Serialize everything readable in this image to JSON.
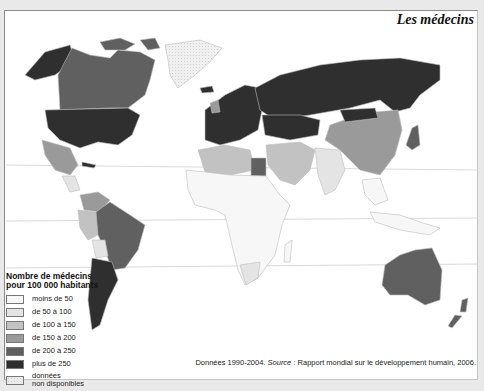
{
  "title": "Les médecins",
  "legend": {
    "title_line1": "Nombre de médecins",
    "title_line2": "pour 100 000 habitants",
    "items": [
      {
        "label": "moins de 50",
        "color": "#f7f7f7"
      },
      {
        "label": "de 50 à 100",
        "color": "#e4e4e4"
      },
      {
        "label": "de 100 à 150",
        "color": "#c2c2c2"
      },
      {
        "label": "de 150 à 200",
        "color": "#9a9a9a"
      },
      {
        "label": "de 200 à 250",
        "color": "#606060"
      },
      {
        "label": "plus de 250",
        "color": "#2f2f2f"
      },
      {
        "label": "données non disponibles",
        "label_line1": "données",
        "label_line2": "non disponibles",
        "color": "#ececec",
        "pattern": "dotted"
      }
    ]
  },
  "source": {
    "prefix": "Données 1990-2004. ",
    "source_word": "Source",
    "rest": " : Rapport mondial sur le développement humain, 2006."
  },
  "map_regions": [
    {
      "name": "Alaska / États-Unis",
      "class": "plus de 250"
    },
    {
      "name": "Canada",
      "class": "de 200 à 250"
    },
    {
      "name": "Groenland",
      "class": "données non disponibles"
    },
    {
      "name": "Mexique",
      "class": "de 150 à 200"
    },
    {
      "name": "Cuba",
      "class": "plus de 250"
    },
    {
      "name": "Amérique centrale",
      "class": "de 50 à 100"
    },
    {
      "name": "Brésil",
      "class": "de 200 à 250"
    },
    {
      "name": "Argentine",
      "class": "plus de 250"
    },
    {
      "name": "Pérou / Colombie",
      "class": "de 100 à 150"
    },
    {
      "name": "Bolivie",
      "class": "de 50 à 100"
    },
    {
      "name": "Europe",
      "class": "plus de 250"
    },
    {
      "name": "Russie",
      "class": "plus de 250"
    },
    {
      "name": "Afrique du Nord",
      "class": "de 100 à 150"
    },
    {
      "name": "Égypte",
      "class": "de 200 à 250"
    },
    {
      "name": "Afrique subsaharienne",
      "class": "moins de 50"
    },
    {
      "name": "Moyen-Orient",
      "class": "de 100 à 150"
    },
    {
      "name": "Chine",
      "class": "de 150 à 200"
    },
    {
      "name": "Inde",
      "class": "de 50 à 100"
    },
    {
      "name": "Asie du Sud-Est",
      "class": "moins de 50"
    },
    {
      "name": "Japon",
      "class": "de 200 à 250"
    },
    {
      "name": "Australie",
      "class": "de 200 à 250"
    },
    {
      "name": "Nouvelle-Zélande",
      "class": "de 200 à 250"
    }
  ]
}
